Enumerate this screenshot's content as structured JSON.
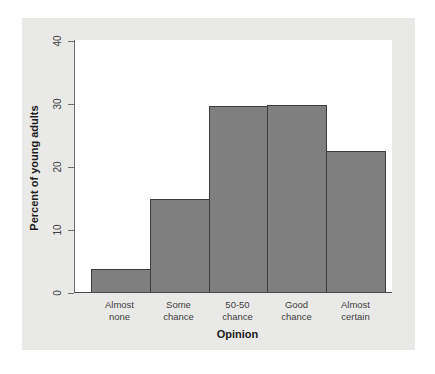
{
  "chart_data": {
    "type": "bar",
    "title": "",
    "xlabel": "Opinion",
    "ylabel": "Percent of young adults",
    "categories": [
      "Almost none",
      "Some chance",
      "50-50 chance",
      "Good chance",
      "Almost certain"
    ],
    "category_lines": [
      [
        "Almost",
        "none"
      ],
      [
        "Some",
        "chance"
      ],
      [
        "50-50",
        "chance"
      ],
      [
        "Good",
        "chance"
      ],
      [
        "Almost",
        "certain"
      ]
    ],
    "values": [
      3.7,
      14.8,
      29.6,
      29.7,
      22.4
    ],
    "ylim": [
      0,
      40
    ],
    "yticks": [
      0,
      10,
      20,
      30,
      40
    ],
    "ytick_labels": [
      "0",
      "10",
      "20",
      "30",
      "40"
    ],
    "grid": false,
    "legend": null,
    "bar_color": "#7f7f7f",
    "bar_edge_color": "#3d3d3d",
    "plot_background": "#ffffff",
    "figure_background": "#e9e9e7",
    "axis_color": "#4a4a4a"
  }
}
